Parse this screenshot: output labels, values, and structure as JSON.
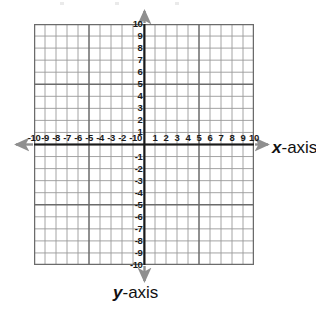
{
  "figure": {
    "kind": "cartesian-coordinate-plane",
    "background_color": "#ffffff",
    "grid_color": "#7d7d7d",
    "axis_color": "#1a1a1a",
    "arrow_color": "#8c8c8c",
    "label_color": "#111111"
  },
  "labels": {
    "x_axis_name_italic": "x",
    "x_axis_name_rest": "-axis",
    "y_axis_name_italic": "y",
    "y_axis_name_rest": "-axis"
  },
  "chart_data": {
    "type": "scatter",
    "title": "",
    "subtitle": "",
    "xlabel": "x-axis",
    "ylabel": "y-axis",
    "xlim": [
      -10,
      10
    ],
    "ylim": [
      -10,
      10
    ],
    "grid": true,
    "legend": null,
    "series": [],
    "x_ticks": [
      -10,
      -9,
      -8,
      -7,
      -6,
      -5,
      -4,
      -3,
      -2,
      -1,
      0,
      1,
      2,
      3,
      4,
      5,
      6,
      7,
      8,
      9,
      10
    ],
    "y_ticks": [
      10,
      9,
      8,
      7,
      6,
      5,
      4,
      3,
      2,
      1,
      -1,
      -2,
      -3,
      -4,
      -5,
      -6,
      -7,
      -8,
      -9,
      -10
    ],
    "x_tick_labels": [
      "-10",
      "-9",
      "-8",
      "-7",
      "-6",
      "-5",
      "-4",
      "-3",
      "-2",
      "-1",
      "0",
      "1",
      "2",
      "3",
      "4",
      "5",
      "6",
      "7",
      "8",
      "9",
      "10"
    ],
    "y_tick_labels": [
      "10",
      "9",
      "8",
      "7",
      "6",
      "5",
      "4",
      "3",
      "2",
      "1",
      "-1",
      "-2",
      "-3",
      "-4",
      "-5",
      "-6",
      "-7",
      "-8",
      "-9",
      "-10"
    ],
    "x_major_gridlines": [
      -10,
      -5,
      0,
      5,
      10
    ],
    "y_major_gridlines": [
      10,
      5,
      0,
      -5,
      -10
    ],
    "origin_label": "0",
    "annotations": []
  }
}
